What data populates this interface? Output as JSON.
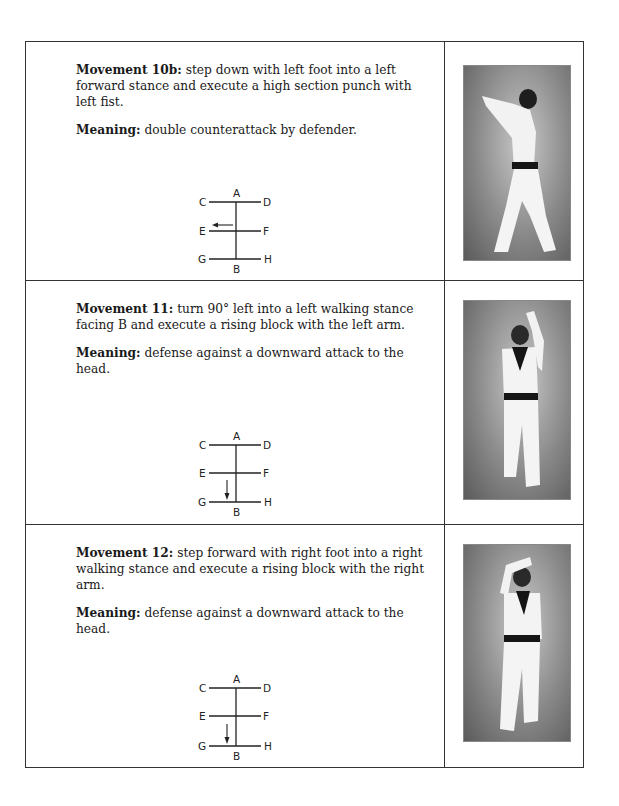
{
  "movements": [
    {
      "label": "Movement 10b:",
      "description": "step down with left foot into a left forward stance and execute a high section punch with left fist.",
      "meaning_label": "Meaning:",
      "meaning": "double counterattack by defender.",
      "diagram": {
        "points": [
          "A",
          "B",
          "C",
          "D",
          "E",
          "F",
          "G",
          "H"
        ],
        "arrow": "left on E-F line"
      },
      "photo": "figure in left forward stance executing high punch with left fist, seen from back"
    },
    {
      "label": "Movement 11:",
      "description": "turn 90° left into a left walking stance facing B and execute a rising block with the left arm.",
      "meaning_label": "Meaning:",
      "meaning": "defense against a downward attack to the head.",
      "diagram": {
        "points": [
          "A",
          "B",
          "C",
          "D",
          "E",
          "F",
          "G",
          "H"
        ],
        "arrow": "down toward G-H line"
      },
      "photo": "figure in walking stance with left arm rising block, facing camera"
    },
    {
      "label": "Movement 12:",
      "description": "step forward with right foot into a right walking stance and execute a rising block with the right arm.",
      "meaning_label": "Meaning:",
      "meaning": "defense against a downward attack to the head.",
      "diagram": {
        "points": [
          "A",
          "B",
          "C",
          "D",
          "E",
          "F",
          "G",
          "H"
        ],
        "arrow": "down toward G-H line"
      },
      "photo": "figure in walking stance with right arm rising block, facing camera"
    }
  ],
  "labels": {
    "A": "A",
    "B": "B",
    "C": "C",
    "D": "D",
    "E": "E",
    "F": "F",
    "G": "G",
    "H": "H"
  }
}
